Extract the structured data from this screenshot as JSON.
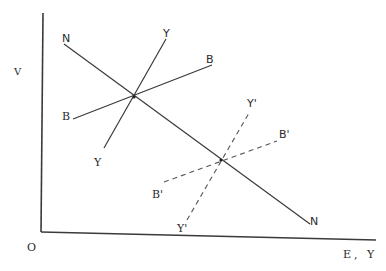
{
  "diagram": {
    "type": "economics-curve-diagram",
    "axes": {
      "y_label": "V",
      "x_label": "E, Y",
      "origin_label": "O"
    },
    "curves": [
      {
        "id": "NN",
        "style": "solid",
        "start_label": "N",
        "end_label": "N",
        "description": "downward-sloping line from upper-left to lower-right"
      },
      {
        "id": "BB",
        "style": "solid",
        "start_label": "B",
        "end_label": "B",
        "description": "upward-sloping line, shallow"
      },
      {
        "id": "YY",
        "style": "solid",
        "start_label": "Y",
        "end_label": "Y",
        "description": "upward-sloping line, steep"
      },
      {
        "id": "B'B'",
        "style": "dashed",
        "start_label": "B'",
        "end_label": "B'",
        "description": "shifted BB curve, shallow, dashed"
      },
      {
        "id": "Y'Y'",
        "style": "dashed",
        "start_label": "Y'",
        "end_label": "Y'",
        "description": "shifted YY curve, steep, dashed"
      }
    ],
    "intersections": [
      {
        "curves": [
          "NN",
          "BB",
          "YY"
        ],
        "label": "initial equilibrium"
      },
      {
        "curves": [
          "NN",
          "B'B'",
          "Y'Y'"
        ],
        "label": "new equilibrium"
      }
    ]
  },
  "labels": {
    "v_axis": "V",
    "origin": "O",
    "x_axis": "E, Y",
    "n_top": "N",
    "n_bottom": "N",
    "y_top": "Y",
    "y_bottom": "Y",
    "b_top": "B",
    "b_bottom": "B",
    "y_prime_top": "Y'",
    "y_prime_bottom": "Y'",
    "b_prime_top": "B'",
    "b_prime_bottom": "B'"
  }
}
